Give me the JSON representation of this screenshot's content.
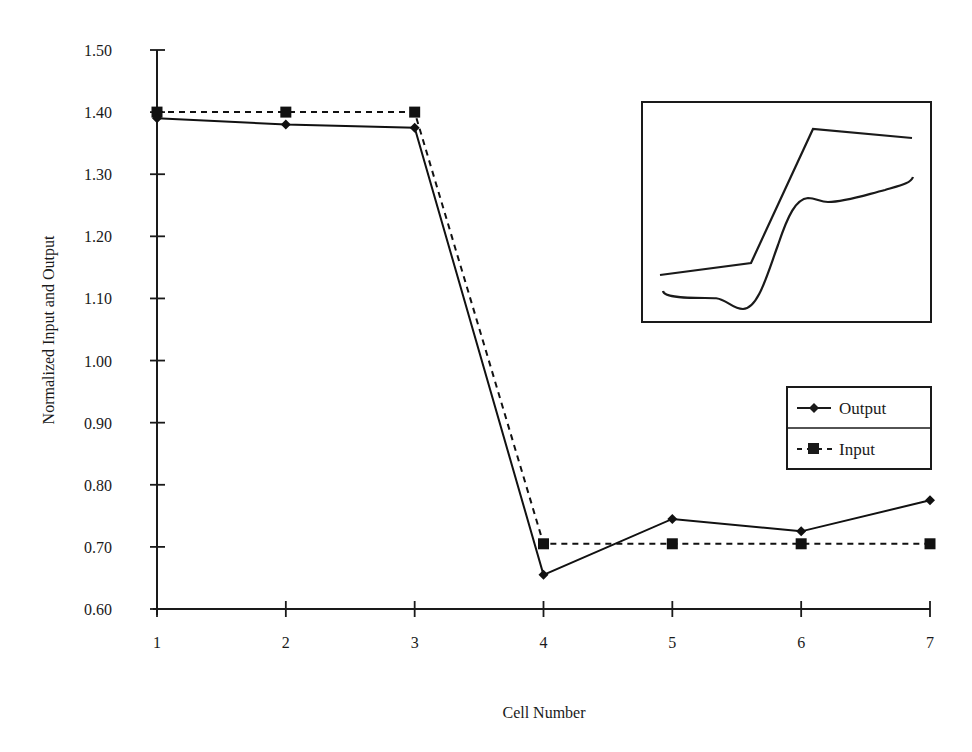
{
  "chart_data": {
    "type": "line",
    "title": "",
    "xlabel": "Cell Number",
    "ylabel": "Normalized Input and Output",
    "x": [
      1,
      2,
      3,
      4,
      5,
      6,
      7
    ],
    "x_ticks": [
      "1",
      "2",
      "3",
      "4",
      "5",
      "6",
      "7"
    ],
    "y_ticks": [
      "0.60",
      "0.70",
      "0.80",
      "0.90",
      "1.00",
      "1.10",
      "1.20",
      "1.30",
      "1.40",
      "1.50"
    ],
    "ylim": [
      0.6,
      1.5
    ],
    "xlim": [
      1,
      7
    ],
    "grid": false,
    "legend_position": "right-middle",
    "series": [
      {
        "name": "Output",
        "marker": "diamond",
        "line_style": "solid",
        "color": "#111111",
        "values": [
          1.39,
          1.38,
          1.375,
          0.655,
          0.745,
          0.725,
          0.775
        ]
      },
      {
        "name": "Input",
        "marker": "square",
        "line_style": "dashed",
        "color": "#111111",
        "values": [
          1.4,
          1.4,
          1.4,
          0.705,
          0.705,
          0.705,
          0.705
        ]
      }
    ],
    "inset": {
      "description": "Unlabeled inset sketch of two curves (stepped rise)",
      "has_axes": false
    }
  },
  "legend": {
    "items": [
      {
        "label": "Output",
        "marker": "diamond",
        "line_style": "solid"
      },
      {
        "label": "Input",
        "marker": "square",
        "line_style": "dashed"
      }
    ]
  },
  "axes": {
    "x_title": "Cell Number",
    "y_title": "Normalized Input and Output"
  }
}
